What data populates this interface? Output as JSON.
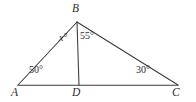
{
  "figure": {
    "background_color": "#ffffff",
    "stroke_color": "#3b3b3b",
    "text_color": "#2e2e2e",
    "width": 196,
    "height": 102,
    "vertices": [
      {
        "name": "A",
        "label": "A",
        "x": 18,
        "y": 85
      },
      {
        "name": "B",
        "label": "B",
        "x": 77,
        "y": 22
      },
      {
        "name": "C",
        "label": "C",
        "x": 178,
        "y": 85
      },
      {
        "name": "D",
        "label": "D",
        "x": 79,
        "y": 85
      }
    ],
    "segments": [
      {
        "name": "side-AB",
        "from": "A",
        "to": "B"
      },
      {
        "name": "side-BC",
        "from": "B",
        "to": "C"
      },
      {
        "name": "base-AC",
        "from": "A",
        "to": "C"
      },
      {
        "name": "cevian-BD",
        "from": "B",
        "to": "D"
      }
    ],
    "angles": [
      {
        "name": "angle-ABD",
        "at": "B",
        "value": "x",
        "unit": "°",
        "text": "x°",
        "is_variable": true
      },
      {
        "name": "angle-DBC",
        "at": "B",
        "value": "55",
        "unit": "°",
        "text": "55°",
        "is_variable": false
      },
      {
        "name": "angle-BAD",
        "at": "A",
        "value": "50",
        "unit": "°",
        "text": "50°",
        "is_variable": false
      },
      {
        "name": "angle-BCD",
        "at": "C",
        "value": "30",
        "unit": "°",
        "text": "30°",
        "is_variable": false
      }
    ],
    "labels": {
      "vertex_a": "A",
      "vertex_b": "B",
      "vertex_c": "C",
      "vertex_d": "D",
      "angle_x": "x",
      "angle_x_degree": "°",
      "angle_55": "55°",
      "angle_50": "50°",
      "angle_30": "30°"
    }
  }
}
